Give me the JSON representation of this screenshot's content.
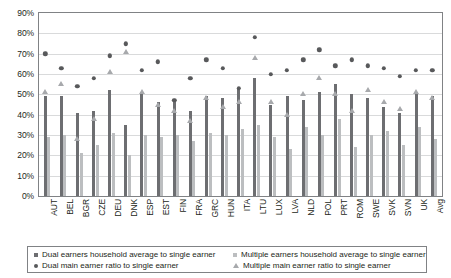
{
  "chart_data": {
    "type": "bar",
    "title": "",
    "xlabel": "",
    "ylabel": "",
    "ylim": [
      0,
      90
    ],
    "ytick_step": 10,
    "ytick_labels": [
      "0%",
      "10%",
      "20%",
      "30%",
      "40%",
      "50%",
      "60%",
      "70%",
      "80%",
      "90%"
    ],
    "grid": true,
    "legend_position": "bottom",
    "categories": [
      "AUT",
      "BEL",
      "BGR",
      "CZE",
      "DEU",
      "DNK",
      "ESP",
      "EST",
      "FIN",
      "FRA",
      "GRC",
      "HUN",
      "ITA",
      "LTU",
      "LUX",
      "LVA",
      "NLD",
      "POL",
      "PRT",
      "ROM",
      "SWE",
      "SVK",
      "SVN",
      "UK",
      "Avg"
    ],
    "series": [
      {
        "name": "Dual earners household average to single earner",
        "type": "bar",
        "color": "#6d6e71",
        "values": [
          49,
          49,
          41,
          42,
          52,
          35,
          51,
          46,
          47,
          42,
          49,
          48,
          53,
          58,
          45,
          49,
          47,
          51,
          55,
          50,
          48,
          44,
          41,
          51,
          49
        ]
      },
      {
        "name": "Multiple earners household average to single earner",
        "type": "bar",
        "color": "#bcbec0",
        "values": [
          29,
          30,
          21,
          25,
          31,
          20,
          30,
          29,
          30,
          27,
          31,
          30,
          33,
          35,
          29,
          23,
          34,
          30,
          38,
          24,
          30,
          32,
          25,
          34,
          28
        ]
      },
      {
        "name": "Dual main earner ratio to single earner",
        "type": "scatter-dot",
        "color": "#58595b",
        "values": [
          70,
          63,
          54,
          58,
          69,
          75,
          62,
          66,
          47,
          58,
          67,
          63,
          53,
          78,
          60,
          62,
          67,
          72,
          64,
          67,
          64,
          63,
          59,
          62,
          62
        ]
      },
      {
        "name": "Multiple main earner ratio to single earner",
        "type": "scatter-triangle",
        "color": "#a7a9ac",
        "values": [
          51,
          55,
          28,
          38,
          61,
          71,
          51,
          45,
          42,
          37,
          48,
          44,
          46,
          68,
          46,
          40,
          50,
          58,
          50,
          42,
          52,
          46,
          43,
          51,
          48
        ]
      }
    ]
  },
  "legend": {
    "items": [
      {
        "marker": "square-dark",
        "label": "Dual earners household average to single earner"
      },
      {
        "marker": "square-light",
        "label": "Multiple earners household average to single earner"
      },
      {
        "marker": "dot",
        "label": "Dual main earner ratio to single earner"
      },
      {
        "marker": "triangle",
        "label": "Multiple main earner ratio to single earner"
      }
    ]
  }
}
